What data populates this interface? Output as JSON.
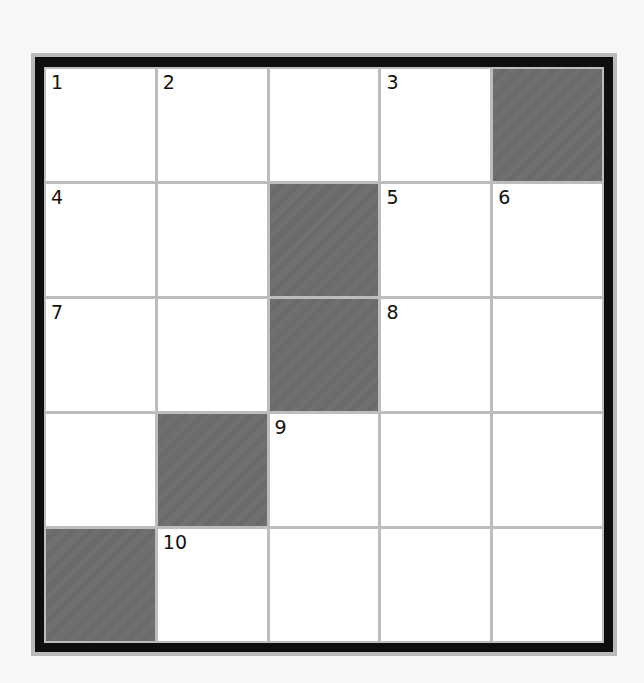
{
  "puzzle": {
    "type": "crossword",
    "rows": 5,
    "cols": 5,
    "colors": {
      "background": "#f7f7f5",
      "border": "#0e0e0e",
      "grid_lines": "#bdbdbd",
      "block": "#6b6b6b",
      "cell": "#ffffff"
    },
    "cells": [
      [
        {
          "block": false,
          "number": "1",
          "letter": ""
        },
        {
          "block": false,
          "number": "2",
          "letter": ""
        },
        {
          "block": false,
          "number": "",
          "letter": ""
        },
        {
          "block": false,
          "number": "3",
          "letter": ""
        },
        {
          "block": true,
          "number": "",
          "letter": ""
        }
      ],
      [
        {
          "block": false,
          "number": "4",
          "letter": ""
        },
        {
          "block": false,
          "number": "",
          "letter": ""
        },
        {
          "block": true,
          "number": "",
          "letter": ""
        },
        {
          "block": false,
          "number": "5",
          "letter": ""
        },
        {
          "block": false,
          "number": "6",
          "letter": ""
        }
      ],
      [
        {
          "block": false,
          "number": "7",
          "letter": ""
        },
        {
          "block": false,
          "number": "",
          "letter": ""
        },
        {
          "block": true,
          "number": "",
          "letter": ""
        },
        {
          "block": false,
          "number": "8",
          "letter": ""
        },
        {
          "block": false,
          "number": "",
          "letter": ""
        }
      ],
      [
        {
          "block": false,
          "number": "",
          "letter": ""
        },
        {
          "block": true,
          "number": "",
          "letter": ""
        },
        {
          "block": false,
          "number": "9",
          "letter": ""
        },
        {
          "block": false,
          "number": "",
          "letter": ""
        },
        {
          "block": false,
          "number": "",
          "letter": ""
        }
      ],
      [
        {
          "block": true,
          "number": "",
          "letter": ""
        },
        {
          "block": false,
          "number": "10",
          "letter": ""
        },
        {
          "block": false,
          "number": "",
          "letter": ""
        },
        {
          "block": false,
          "number": "",
          "letter": ""
        },
        {
          "block": false,
          "number": "",
          "letter": ""
        }
      ]
    ]
  }
}
